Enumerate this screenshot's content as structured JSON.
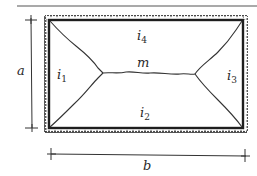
{
  "diagram": {
    "type": "yield-line pattern of a slab supported on four edges",
    "labels": {
      "side_a": "a",
      "side_b": "b",
      "moment_m": "m",
      "i1_base": "i",
      "i1_sub": "1",
      "i2_base": "i",
      "i2_sub": "2",
      "i3_base": "i",
      "i3_sub": "3",
      "i4_base": "i",
      "i4_sub": "4"
    },
    "colors": {
      "line": "#1e1e1e",
      "support_hatch": "#2a2a2a",
      "label": "#2a2a2a",
      "rule": "#555555"
    },
    "regions": [
      "i1 (left)",
      "i2 (bottom)",
      "i3 (right)",
      "i4 (top)"
    ],
    "edges": [
      "fixed/supported top",
      "fixed/supported bottom",
      "fixed/supported left",
      "fixed/supported right"
    ]
  }
}
